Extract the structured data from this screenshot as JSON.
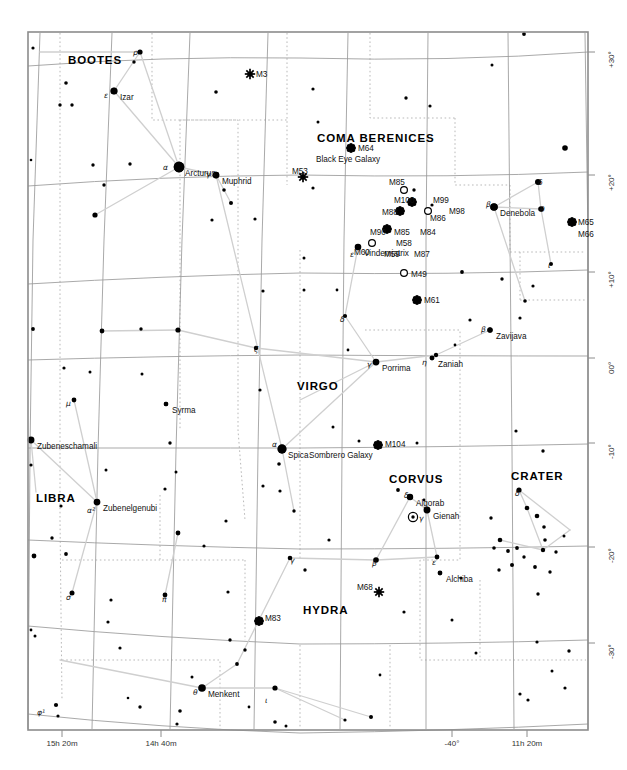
{
  "chart_data": {
    "type": "scatter",
    "xlabel": "Right Ascension",
    "ylabel": "Declination",
    "grid": true,
    "legend": "none",
    "frame": {
      "x": 28,
      "y": 32,
      "width": 560,
      "height": 698
    },
    "ra_ticks": [
      {
        "label": "15h 20m",
        "x": 62
      },
      {
        "label": "14h 40m",
        "x": 161
      },
      {
        "label": "-40°",
        "x": 452
      },
      {
        "label": "11h 20m",
        "x": 527
      }
    ],
    "dec_ticks": [
      {
        "label": "+30°",
        "y": 52
      },
      {
        "label": "+20°",
        "y": 175
      },
      {
        "label": "+10°",
        "y": 272
      },
      {
        "label": "00°",
        "y": 358
      },
      {
        "label": "-10°",
        "y": 443
      },
      {
        "label": "-20°",
        "y": 547
      },
      {
        "label": "-30°",
        "y": 643
      }
    ],
    "constellations": [
      {
        "name": "BOOTES",
        "x": 68,
        "y": 54
      },
      {
        "name": "COMA BERENICES",
        "x": 317,
        "y": 132
      },
      {
        "name": "VIRGO",
        "x": 297,
        "y": 380
      },
      {
        "name": "LIBRA",
        "x": 36,
        "y": 492
      },
      {
        "name": "CORVUS",
        "x": 389,
        "y": 473
      },
      {
        "name": "CRATER",
        "x": 511,
        "y": 470
      },
      {
        "name": "HYDRA",
        "x": 303,
        "y": 604
      }
    ],
    "named_stars": [
      {
        "name": "Arcturus",
        "x": 179,
        "y": 167,
        "mag": 0.0,
        "greek": "α",
        "gx": 163,
        "gy": 163
      },
      {
        "name": "Izar",
        "x": 114,
        "y": 91,
        "mag": 2.4,
        "greek": "ε",
        "gx": 104,
        "gy": 91
      },
      {
        "name": "Muphrid",
        "x": 216,
        "y": 175,
        "mag": 2.7,
        "greek": "γ",
        "gx": 206,
        "gy": 170
      },
      {
        "name": "Denebola",
        "x": 494,
        "y": 207,
        "mag": 2.1,
        "greek": "β",
        "gx": 486,
        "gy": 200
      },
      {
        "name": "Vindemiatrix",
        "x": 358,
        "y": 247,
        "mag": 2.8,
        "greek": "ε",
        "gx": 350,
        "gy": 250
      },
      {
        "name": "Zavijava",
        "x": 490,
        "y": 330,
        "mag": 3.6,
        "greek": "β",
        "gx": 481,
        "gy": 325
      },
      {
        "name": "Zaniah",
        "x": 432,
        "y": 358,
        "mag": 3.9,
        "greek": "η",
        "gx": 422,
        "gy": 358
      },
      {
        "name": "Porrima",
        "x": 376,
        "y": 362,
        "mag": 2.7,
        "greek": "γ",
        "gx": 367,
        "gy": 360
      },
      {
        "name": "Syrma",
        "x": 166,
        "y": 404,
        "mag": 4.1,
        "greek": "",
        "gx": 0,
        "gy": 0
      },
      {
        "name": "Zubeneschamali",
        "x": 31,
        "y": 440,
        "mag": 2.6,
        "greek": "",
        "gx": 0,
        "gy": 0
      },
      {
        "name": "Zubenelgenubi",
        "x": 97,
        "y": 502,
        "mag": 2.7,
        "greek": "α²",
        "gx": 87,
        "gy": 506
      },
      {
        "name": "Spica",
        "x": 282,
        "y": 449,
        "mag": 1.0,
        "greek": "α",
        "gx": 272,
        "gy": 440
      },
      {
        "name": "Algorab",
        "x": 410,
        "y": 497,
        "mag": 2.9,
        "greek": "δ",
        "gx": 404,
        "gy": 491
      },
      {
        "name": "Gienah",
        "x": 427,
        "y": 510,
        "mag": 2.6,
        "greek": "γ",
        "gx": 419,
        "gy": 514
      },
      {
        "name": "Alchiba",
        "x": 440,
        "y": 573,
        "mag": 4.0,
        "greek": "",
        "gx": 0,
        "gy": 0
      },
      {
        "name": "Menkent",
        "x": 202,
        "y": 688,
        "mag": 2.1,
        "greek": "θ",
        "gx": 193,
        "gy": 688
      }
    ],
    "messier_objects": [
      {
        "id": "M3",
        "x": 250,
        "y": 74,
        "kind": "cluster",
        "lx": 256,
        "ly": 70
      },
      {
        "id": "M53",
        "x": 303,
        "y": 177,
        "kind": "cluster",
        "lx": 292,
        "ly": 167
      },
      {
        "id": "M64",
        "x": 351,
        "y": 148,
        "kind": "galaxy",
        "lx": 358,
        "ly": 144,
        "sub": "Black Eye Galaxy"
      },
      {
        "id": "M85",
        "x": 404,
        "y": 190,
        "kind": "open",
        "lx": 389,
        "ly": 178
      },
      {
        "id": "M100",
        "x": 412,
        "y": 202,
        "kind": "galaxy",
        "lx": 394,
        "ly": 196
      },
      {
        "id": "M99",
        "x": 435,
        "y": 199,
        "kind": "none",
        "lx": 433,
        "ly": 196
      },
      {
        "id": "M98",
        "x": 452,
        "y": 209,
        "kind": "none",
        "lx": 449,
        "ly": 207
      },
      {
        "id": "M86",
        "x": 428,
        "y": 211,
        "kind": "open",
        "lx": 430,
        "ly": 214
      },
      {
        "id": "M88",
        "x": 400,
        "y": 211,
        "kind": "galaxy",
        "lx": 382,
        "ly": 208
      },
      {
        "id": "M90",
        "x": 387,
        "y": 229,
        "kind": "galaxy",
        "lx": 370,
        "ly": 228
      },
      {
        "id": "M85b",
        "x": 0,
        "y": 0,
        "kind": "none",
        "lx": 394,
        "ly": 228,
        "label": "M85"
      },
      {
        "id": "M84",
        "x": 0,
        "y": 0,
        "kind": "none",
        "lx": 420,
        "ly": 228
      },
      {
        "id": "M58",
        "x": 0,
        "y": 0,
        "kind": "none",
        "lx": 396,
        "ly": 239
      },
      {
        "id": "M59",
        "x": 0,
        "y": 0,
        "kind": "none",
        "lx": 384,
        "ly": 250
      },
      {
        "id": "M87",
        "x": 0,
        "y": 0,
        "kind": "none",
        "lx": 414,
        "ly": 250
      },
      {
        "id": "M60",
        "x": 372,
        "y": 243,
        "kind": "open",
        "lx": 354,
        "ly": 248
      },
      {
        "id": "M49",
        "x": 404,
        "y": 273,
        "kind": "open",
        "lx": 411,
        "ly": 270
      },
      {
        "id": "M61",
        "x": 417,
        "y": 300,
        "kind": "galaxy",
        "lx": 424,
        "ly": 296
      },
      {
        "id": "M65",
        "x": 572,
        "y": 222,
        "kind": "galaxy",
        "lx": 578,
        "ly": 218
      },
      {
        "id": "M66",
        "x": 0,
        "y": 0,
        "kind": "none",
        "lx": 578,
        "ly": 230
      },
      {
        "id": "M104",
        "x": 378,
        "y": 445,
        "kind": "galaxy",
        "lx": 385,
        "ly": 440,
        "sub": "Sombrero Galaxy"
      },
      {
        "id": "M68",
        "x": 379,
        "y": 592,
        "kind": "cluster",
        "lx": 357,
        "ly": 583
      },
      {
        "id": "M83",
        "x": 259,
        "y": 621,
        "kind": "galaxy",
        "lx": 265,
        "ly": 614
      }
    ],
    "extra_greek_labels": [
      {
        "ch": "ρ",
        "x": 133,
        "y": 48
      },
      {
        "ch": "δ",
        "x": 538,
        "y": 178
      },
      {
        "ch": "θ",
        "x": 540,
        "y": 205
      },
      {
        "ch": "ι",
        "x": 548,
        "y": 261
      },
      {
        "ch": "δ",
        "x": 340,
        "y": 315
      },
      {
        "ch": "ζ",
        "x": 254,
        "y": 345
      },
      {
        "ch": "μ",
        "x": 66,
        "y": 399
      },
      {
        "ch": "δ",
        "x": 515,
        "y": 489
      },
      {
        "ch": "β",
        "x": 372,
        "y": 559
      },
      {
        "ch": "ε",
        "x": 432,
        "y": 558
      },
      {
        "ch": "γ",
        "x": 290,
        "y": 556
      },
      {
        "ch": "σ",
        "x": 66,
        "y": 593
      },
      {
        "ch": "π",
        "x": 162,
        "y": 595
      },
      {
        "ch": "ι",
        "x": 265,
        "y": 696
      },
      {
        "ch": "φ¹",
        "x": 37,
        "y": 708
      }
    ],
    "special_markers": [
      {
        "kind": "circled-dot",
        "x": 413,
        "y": 517,
        "note": "planet symbol in Corvus"
      }
    ],
    "stars": [
      {
        "x": 33,
        "y": 48,
        "r": 1.6
      },
      {
        "x": 140,
        "y": 52,
        "r": 2.6
      },
      {
        "x": 134,
        "y": 62,
        "r": 1.7
      },
      {
        "x": 66,
        "y": 83,
        "r": 1.8
      },
      {
        "x": 114,
        "y": 91,
        "r": 3.2
      },
      {
        "x": 60,
        "y": 105,
        "r": 1.7
      },
      {
        "x": 72,
        "y": 105,
        "r": 1.7
      },
      {
        "x": 216,
        "y": 92,
        "r": 1.8
      },
      {
        "x": 313,
        "y": 89,
        "r": 1.6
      },
      {
        "x": 406,
        "y": 98,
        "r": 1.7
      },
      {
        "x": 430,
        "y": 106,
        "r": 1.6
      },
      {
        "x": 524,
        "y": 34,
        "r": 1.9
      },
      {
        "x": 565,
        "y": 148,
        "r": 2.8
      },
      {
        "x": 318,
        "y": 122,
        "r": 1.5
      },
      {
        "x": 492,
        "y": 65,
        "r": 1.5
      },
      {
        "x": 31,
        "y": 160,
        "r": 1.3
      },
      {
        "x": 93,
        "y": 165,
        "r": 1.7
      },
      {
        "x": 130,
        "y": 164,
        "r": 1.7
      },
      {
        "x": 179,
        "y": 167,
        "r": 5.2
      },
      {
        "x": 216,
        "y": 175,
        "r": 3.2
      },
      {
        "x": 224,
        "y": 190,
        "r": 1.8
      },
      {
        "x": 231,
        "y": 203,
        "r": 2.0
      },
      {
        "x": 104,
        "y": 185,
        "r": 1.7
      },
      {
        "x": 95,
        "y": 215,
        "r": 2.6
      },
      {
        "x": 212,
        "y": 220,
        "r": 1.6
      },
      {
        "x": 255,
        "y": 219,
        "r": 1.6
      },
      {
        "x": 313,
        "y": 188,
        "r": 1.6
      },
      {
        "x": 414,
        "y": 190,
        "r": 1.7
      },
      {
        "x": 432,
        "y": 205,
        "r": 1.6
      },
      {
        "x": 494,
        "y": 207,
        "r": 3.6
      },
      {
        "x": 538,
        "y": 182,
        "r": 3.0
      },
      {
        "x": 541,
        "y": 209,
        "r": 2.8
      },
      {
        "x": 551,
        "y": 264,
        "r": 2.0
      },
      {
        "x": 358,
        "y": 247,
        "r": 2.8
      },
      {
        "x": 304,
        "y": 258,
        "r": 1.5
      },
      {
        "x": 304,
        "y": 290,
        "r": 1.5
      },
      {
        "x": 462,
        "y": 272,
        "r": 1.9
      },
      {
        "x": 502,
        "y": 279,
        "r": 1.7
      },
      {
        "x": 533,
        "y": 286,
        "r": 1.6
      },
      {
        "x": 525,
        "y": 301,
        "r": 1.8
      },
      {
        "x": 490,
        "y": 330,
        "r": 2.6
      },
      {
        "x": 436,
        "y": 355,
        "r": 2.2
      },
      {
        "x": 376,
        "y": 362,
        "r": 2.6
      },
      {
        "x": 345,
        "y": 316,
        "r": 2.1
      },
      {
        "x": 263,
        "y": 291,
        "r": 1.6
      },
      {
        "x": 178,
        "y": 330,
        "r": 2.6
      },
      {
        "x": 102,
        "y": 331,
        "r": 2.4
      },
      {
        "x": 33,
        "y": 329,
        "r": 1.9
      },
      {
        "x": 141,
        "y": 329,
        "r": 1.7
      },
      {
        "x": 64,
        "y": 368,
        "r": 1.6
      },
      {
        "x": 90,
        "y": 372,
        "r": 1.5
      },
      {
        "x": 142,
        "y": 374,
        "r": 1.5
      },
      {
        "x": 256,
        "y": 348,
        "r": 2.2
      },
      {
        "x": 260,
        "y": 390,
        "r": 1.6
      },
      {
        "x": 166,
        "y": 404,
        "r": 2.2
      },
      {
        "x": 74,
        "y": 400,
        "r": 2.4
      },
      {
        "x": 31,
        "y": 440,
        "r": 2.8
      },
      {
        "x": 31,
        "y": 465,
        "r": 1.6
      },
      {
        "x": 170,
        "y": 443,
        "r": 1.7
      },
      {
        "x": 282,
        "y": 449,
        "r": 4.2
      },
      {
        "x": 279,
        "y": 464,
        "r": 1.8
      },
      {
        "x": 280,
        "y": 491,
        "r": 1.6
      },
      {
        "x": 294,
        "y": 511,
        "r": 1.7
      },
      {
        "x": 106,
        "y": 470,
        "r": 1.5
      },
      {
        "x": 97,
        "y": 502,
        "r": 2.8
      },
      {
        "x": 61,
        "y": 506,
        "r": 1.6
      },
      {
        "x": 52,
        "y": 538,
        "r": 1.7
      },
      {
        "x": 176,
        "y": 472,
        "r": 1.5
      },
      {
        "x": 165,
        "y": 489,
        "r": 1.6
      },
      {
        "x": 398,
        "y": 490,
        "r": 1.9
      },
      {
        "x": 410,
        "y": 497,
        "r": 2.8
      },
      {
        "x": 427,
        "y": 510,
        "r": 2.9
      },
      {
        "x": 376,
        "y": 560,
        "r": 2.8
      },
      {
        "x": 437,
        "y": 557,
        "r": 2.4
      },
      {
        "x": 440,
        "y": 573,
        "r": 2.0
      },
      {
        "x": 333,
        "y": 427,
        "r": 1.5
      },
      {
        "x": 359,
        "y": 441,
        "r": 1.5
      },
      {
        "x": 417,
        "y": 443,
        "r": 1.5
      },
      {
        "x": 516,
        "y": 431,
        "r": 1.6
      },
      {
        "x": 543,
        "y": 451,
        "r": 1.7
      },
      {
        "x": 519,
        "y": 490,
        "r": 2.6
      },
      {
        "x": 527,
        "y": 508,
        "r": 2.3
      },
      {
        "x": 537,
        "y": 516,
        "r": 2.3
      },
      {
        "x": 544,
        "y": 527,
        "r": 1.8
      },
      {
        "x": 545,
        "y": 540,
        "r": 1.8
      },
      {
        "x": 543,
        "y": 550,
        "r": 2.2
      },
      {
        "x": 491,
        "y": 518,
        "r": 1.7
      },
      {
        "x": 500,
        "y": 540,
        "r": 2.3
      },
      {
        "x": 494,
        "y": 548,
        "r": 1.8
      },
      {
        "x": 508,
        "y": 551,
        "r": 1.9
      },
      {
        "x": 517,
        "y": 548,
        "r": 1.9
      },
      {
        "x": 524,
        "y": 557,
        "r": 1.7
      },
      {
        "x": 512,
        "y": 565,
        "r": 2.0
      },
      {
        "x": 499,
        "y": 570,
        "r": 1.7
      },
      {
        "x": 535,
        "y": 567,
        "r": 1.9
      },
      {
        "x": 550,
        "y": 572,
        "r": 1.7
      },
      {
        "x": 556,
        "y": 552,
        "r": 1.7
      },
      {
        "x": 564,
        "y": 536,
        "r": 1.5
      },
      {
        "x": 565,
        "y": 688,
        "r": 1.6
      },
      {
        "x": 552,
        "y": 671,
        "r": 1.5
      },
      {
        "x": 569,
        "y": 651,
        "r": 1.7
      },
      {
        "x": 537,
        "y": 642,
        "r": 1.6
      },
      {
        "x": 538,
        "y": 594,
        "r": 1.7
      },
      {
        "x": 476,
        "y": 653,
        "r": 1.5
      },
      {
        "x": 452,
        "y": 620,
        "r": 1.5
      },
      {
        "x": 461,
        "y": 578,
        "r": 1.6
      },
      {
        "x": 404,
        "y": 612,
        "r": 1.6
      },
      {
        "x": 329,
        "y": 540,
        "r": 1.6
      },
      {
        "x": 305,
        "y": 570,
        "r": 1.7
      },
      {
        "x": 263,
        "y": 486,
        "r": 1.6
      },
      {
        "x": 226,
        "y": 521,
        "r": 1.6
      },
      {
        "x": 178,
        "y": 533,
        "r": 2.4
      },
      {
        "x": 204,
        "y": 546,
        "r": 1.6
      },
      {
        "x": 165,
        "y": 595,
        "r": 2.4
      },
      {
        "x": 72,
        "y": 593,
        "r": 2.5
      },
      {
        "x": 111,
        "y": 600,
        "r": 1.6
      },
      {
        "x": 108,
        "y": 622,
        "r": 1.6
      },
      {
        "x": 66,
        "y": 554,
        "r": 1.9
      },
      {
        "x": 34,
        "y": 556,
        "r": 2.4
      },
      {
        "x": 35,
        "y": 636,
        "r": 1.5
      },
      {
        "x": 120,
        "y": 648,
        "r": 1.6
      },
      {
        "x": 228,
        "y": 592,
        "r": 1.6
      },
      {
        "x": 290,
        "y": 558,
        "r": 2.3
      },
      {
        "x": 230,
        "y": 640,
        "r": 1.7
      },
      {
        "x": 245,
        "y": 650,
        "r": 1.7
      },
      {
        "x": 237,
        "y": 664,
        "r": 1.9
      },
      {
        "x": 192,
        "y": 677,
        "r": 1.5
      },
      {
        "x": 202,
        "y": 688,
        "r": 2.8
      },
      {
        "x": 275,
        "y": 688,
        "r": 2.6
      },
      {
        "x": 56,
        "y": 705,
        "r": 2.1
      },
      {
        "x": 58,
        "y": 716,
        "r": 1.6
      },
      {
        "x": 140,
        "y": 707,
        "r": 1.7
      },
      {
        "x": 180,
        "y": 711,
        "r": 1.8
      },
      {
        "x": 177,
        "y": 724,
        "r": 1.6
      },
      {
        "x": 275,
        "y": 722,
        "r": 1.8
      },
      {
        "x": 286,
        "y": 726,
        "r": 1.5
      },
      {
        "x": 345,
        "y": 720,
        "r": 1.6
      },
      {
        "x": 371,
        "y": 717,
        "r": 2.0
      },
      {
        "x": 520,
        "y": 694,
        "r": 1.6
      },
      {
        "x": 528,
        "y": 700,
        "r": 1.6
      },
      {
        "x": 128,
        "y": 698,
        "r": 1.3
      },
      {
        "x": 249,
        "y": 707,
        "r": 1.4
      },
      {
        "x": 31,
        "y": 630,
        "r": 1.4
      },
      {
        "x": 380,
        "y": 675,
        "r": 1.4
      },
      {
        "x": 424,
        "y": 500,
        "r": 1.4
      },
      {
        "x": 348,
        "y": 350,
        "r": 1.4
      },
      {
        "x": 455,
        "y": 345,
        "r": 1.4
      },
      {
        "x": 470,
        "y": 320,
        "r": 1.6
      },
      {
        "x": 520,
        "y": 318,
        "r": 1.6
      },
      {
        "x": 337,
        "y": 290,
        "r": 1.4
      }
    ]
  },
  "axes": {
    "ra_title": "Right Ascension",
    "dec_title": "Declination"
  }
}
